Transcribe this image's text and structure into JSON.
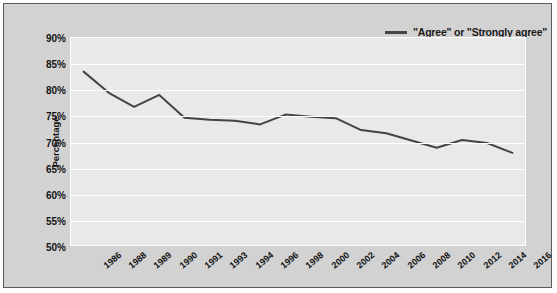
{
  "chart_data": {
    "type": "line",
    "title": "",
    "xlabel": "",
    "ylabel": "Percentage",
    "ylim": [
      50,
      90
    ],
    "ytick_step": 5,
    "grid": true,
    "legend_position": "top-right",
    "ytick_labels": [
      "90%",
      "85%",
      "80%",
      "75%",
      "70%",
      "65%",
      "60%",
      "55%",
      "50%"
    ],
    "categories": [
      "1986",
      "1988",
      "1989",
      "1990",
      "1991",
      "1993",
      "1994",
      "1996",
      "1998",
      "2000",
      "2002",
      "2004",
      "2006",
      "2008",
      "2010",
      "2012",
      "2014",
      "2016"
    ],
    "series": [
      {
        "name": "\"Agree\" or \"Strongly agree\"",
        "color": "#444444",
        "values": [
          83.5,
          79.4,
          76.7,
          79.0,
          74.6,
          74.2,
          74.0,
          73.3,
          75.2,
          74.8,
          74.5,
          72.2,
          71.6,
          70.2,
          68.8,
          70.3,
          69.7,
          67.8
        ]
      }
    ]
  },
  "legend": {
    "label": "\"Agree\" or \"Strongly agree\""
  }
}
